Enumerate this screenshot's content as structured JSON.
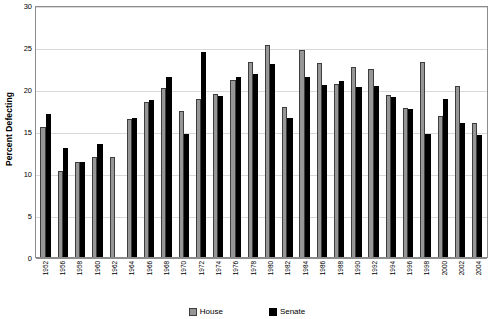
{
  "chart_data": {
    "type": "bar",
    "title": "",
    "xlabel": "",
    "ylabel": "Percent Defecting",
    "ylim": [
      0,
      30
    ],
    "ytick_step": 5,
    "yticks": [
      0,
      5,
      10,
      15,
      20,
      25,
      30
    ],
    "grid": true,
    "legend_position": "bottom",
    "categories": [
      "1952",
      "1956",
      "1958",
      "1960",
      "1962",
      "1964",
      "1966",
      "1968",
      "1970",
      "1972",
      "1974",
      "1976",
      "1978",
      "1980",
      "1982",
      "1984",
      "1986",
      "1988",
      "1990",
      "1992",
      "1994",
      "1996",
      "1998",
      "2000",
      "2002",
      "2004"
    ],
    "series": [
      {
        "name": "House",
        "color": "#969696",
        "values": [
          15.5,
          10.2,
          11.3,
          11.9,
          11.9,
          16.4,
          18.5,
          20.1,
          17.4,
          18.8,
          19.4,
          21.1,
          23.2,
          25.2,
          17.8,
          24.6,
          23.1,
          20.6,
          22.6,
          22.4,
          19.3,
          17.7,
          23.2,
          16.8,
          20.4,
          15.9
        ],
        "values_note": "gray bars"
      },
      {
        "name": "Senate",
        "color": "#000000",
        "values": [
          17.0,
          13.0,
          11.3,
          13.5,
          null,
          16.6,
          18.7,
          21.4,
          14.7,
          24.4,
          19.2,
          21.4,
          21.8,
          23.0,
          16.5,
          21.4,
          20.5,
          21.0,
          20.2,
          20.3,
          19.0,
          17.6,
          14.6,
          18.8,
          15.9,
          14.5
        ],
        "values_note": "black bars; 1962 has no Senate bar"
      }
    ]
  },
  "legend": {
    "items": [
      {
        "label": "House",
        "swatch": "house-swatch"
      },
      {
        "label": "Senate",
        "swatch": "senate-swatch"
      }
    ]
  }
}
